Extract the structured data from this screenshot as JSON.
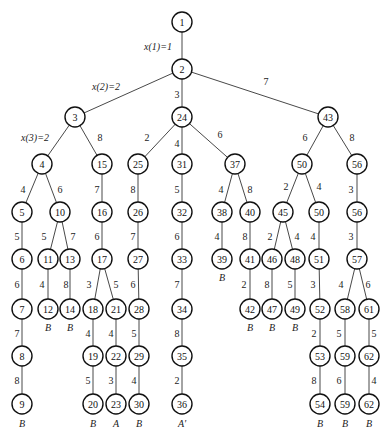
{
  "diagram": {
    "type": "search-tree",
    "node_radius": 10,
    "nodes": [
      {
        "id": "n1",
        "label": "1",
        "x": 182,
        "y": 22
      },
      {
        "id": "n2",
        "label": "2",
        "x": 182,
        "y": 69
      },
      {
        "id": "n3",
        "label": "3",
        "x": 75,
        "y": 117
      },
      {
        "id": "n24",
        "label": "24",
        "x": 182,
        "y": 117
      },
      {
        "id": "n43",
        "label": "43",
        "x": 328,
        "y": 117
      },
      {
        "id": "n4",
        "label": "4",
        "x": 42,
        "y": 164
      },
      {
        "id": "n15",
        "label": "15",
        "x": 102,
        "y": 164
      },
      {
        "id": "n25",
        "label": "25",
        "x": 138,
        "y": 164
      },
      {
        "id": "n31",
        "label": "31",
        "x": 182,
        "y": 164
      },
      {
        "id": "n37",
        "label": "37",
        "x": 235,
        "y": 164
      },
      {
        "id": "n50a",
        "label": "50",
        "x": 302,
        "y": 164
      },
      {
        "id": "n56a",
        "label": "56",
        "x": 357,
        "y": 164
      },
      {
        "id": "n5",
        "label": "5",
        "x": 22,
        "y": 212
      },
      {
        "id": "n10",
        "label": "10",
        "x": 60,
        "y": 212
      },
      {
        "id": "n16",
        "label": "16",
        "x": 102,
        "y": 212
      },
      {
        "id": "n26",
        "label": "26",
        "x": 138,
        "y": 212
      },
      {
        "id": "n32",
        "label": "32",
        "x": 182,
        "y": 212
      },
      {
        "id": "n38",
        "label": "38",
        "x": 222,
        "y": 212
      },
      {
        "id": "n40",
        "label": "40",
        "x": 250,
        "y": 212
      },
      {
        "id": "n45",
        "label": "45",
        "x": 283,
        "y": 212
      },
      {
        "id": "n50b",
        "label": "50",
        "x": 319,
        "y": 212
      },
      {
        "id": "n56b",
        "label": "56",
        "x": 357,
        "y": 212
      },
      {
        "id": "n6",
        "label": "6",
        "x": 22,
        "y": 259
      },
      {
        "id": "n11",
        "label": "11",
        "x": 48,
        "y": 259
      },
      {
        "id": "n13",
        "label": "13",
        "x": 70,
        "y": 259
      },
      {
        "id": "n17",
        "label": "17",
        "x": 102,
        "y": 259
      },
      {
        "id": "n27",
        "label": "27",
        "x": 138,
        "y": 259
      },
      {
        "id": "n33",
        "label": "33",
        "x": 182,
        "y": 259
      },
      {
        "id": "n39",
        "label": "39",
        "x": 222,
        "y": 259
      },
      {
        "id": "n41",
        "label": "41",
        "x": 250,
        "y": 259
      },
      {
        "id": "n46",
        "label": "46",
        "x": 272,
        "y": 259
      },
      {
        "id": "n48",
        "label": "48",
        "x": 295,
        "y": 259
      },
      {
        "id": "n51",
        "label": "51",
        "x": 319,
        "y": 259
      },
      {
        "id": "n57",
        "label": "57",
        "x": 357,
        "y": 259
      },
      {
        "id": "n7",
        "label": "7",
        "x": 22,
        "y": 309
      },
      {
        "id": "n12",
        "label": "12",
        "x": 48,
        "y": 309
      },
      {
        "id": "n14",
        "label": "14",
        "x": 70,
        "y": 309
      },
      {
        "id": "n18",
        "label": "18",
        "x": 93,
        "y": 309
      },
      {
        "id": "n21",
        "label": "21",
        "x": 116,
        "y": 309
      },
      {
        "id": "n28",
        "label": "28",
        "x": 139,
        "y": 309
      },
      {
        "id": "n34",
        "label": "34",
        "x": 182,
        "y": 309
      },
      {
        "id": "n42",
        "label": "42",
        "x": 250,
        "y": 309
      },
      {
        "id": "n47",
        "label": "47",
        "x": 272,
        "y": 309
      },
      {
        "id": "n49",
        "label": "49",
        "x": 295,
        "y": 309
      },
      {
        "id": "n52",
        "label": "52",
        "x": 320,
        "y": 309
      },
      {
        "id": "n58",
        "label": "58",
        "x": 345,
        "y": 309
      },
      {
        "id": "n61",
        "label": "61",
        "x": 369,
        "y": 309
      },
      {
        "id": "n8",
        "label": "8",
        "x": 22,
        "y": 356
      },
      {
        "id": "n19",
        "label": "19",
        "x": 93,
        "y": 356
      },
      {
        "id": "n22",
        "label": "22",
        "x": 116,
        "y": 356
      },
      {
        "id": "n29",
        "label": "29",
        "x": 139,
        "y": 356
      },
      {
        "id": "n35",
        "label": "35",
        "x": 182,
        "y": 356
      },
      {
        "id": "n53",
        "label": "53",
        "x": 320,
        "y": 356
      },
      {
        "id": "n59a",
        "label": "59",
        "x": 345,
        "y": 356
      },
      {
        "id": "n62a",
        "label": "62",
        "x": 369,
        "y": 356
      },
      {
        "id": "n9",
        "label": "9",
        "x": 22,
        "y": 404
      },
      {
        "id": "n20",
        "label": "20",
        "x": 93,
        "y": 404
      },
      {
        "id": "n23",
        "label": "23",
        "x": 116,
        "y": 404
      },
      {
        "id": "n30",
        "label": "30",
        "x": 139,
        "y": 404
      },
      {
        "id": "n36",
        "label": "36",
        "x": 182,
        "y": 404
      },
      {
        "id": "n54",
        "label": "54",
        "x": 320,
        "y": 404
      },
      {
        "id": "n59b",
        "label": "59",
        "x": 345,
        "y": 404
      },
      {
        "id": "n62b",
        "label": "62",
        "x": 369,
        "y": 404
      }
    ],
    "edges": [
      {
        "from": "n1",
        "to": "n2",
        "label": "x(1)=1",
        "lx": 158,
        "ly": 46,
        "italic": true
      },
      {
        "from": "n2",
        "to": "n3",
        "label": "x(2)=2",
        "lx": 106,
        "ly": 86,
        "italic": true
      },
      {
        "from": "n2",
        "to": "n24",
        "label": "3",
        "lx": 177,
        "ly": 94
      },
      {
        "from": "n2",
        "to": "n43",
        "label": "7",
        "lx": 266,
        "ly": 81
      },
      {
        "from": "n3",
        "to": "n4",
        "label": "x(3)=2",
        "lx": 35,
        "ly": 137,
        "italic": true
      },
      {
        "from": "n3",
        "to": "n15",
        "label": "8",
        "lx": 100,
        "ly": 137
      },
      {
        "from": "n24",
        "to": "n25",
        "label": "2",
        "lx": 147,
        "ly": 137
      },
      {
        "from": "n24",
        "to": "n31",
        "label": "4",
        "lx": 177,
        "ly": 143
      },
      {
        "from": "n24",
        "to": "n37",
        "label": "6",
        "lx": 220,
        "ly": 134
      },
      {
        "from": "n43",
        "to": "n50a",
        "label": "6",
        "lx": 305,
        "ly": 137
      },
      {
        "from": "n43",
        "to": "n56a",
        "label": "8",
        "lx": 352,
        "ly": 137
      },
      {
        "from": "n4",
        "to": "n5",
        "label": "4",
        "lx": 23,
        "ly": 189
      },
      {
        "from": "n4",
        "to": "n10",
        "label": "6",
        "lx": 60,
        "ly": 189
      },
      {
        "from": "n15",
        "to": "n16",
        "label": "7",
        "lx": 97,
        "ly": 189
      },
      {
        "from": "n25",
        "to": "n26",
        "label": "8",
        "lx": 133,
        "ly": 189
      },
      {
        "from": "n31",
        "to": "n32",
        "label": "5",
        "lx": 177,
        "ly": 189
      },
      {
        "from": "n37",
        "to": "n38",
        "label": "4",
        "lx": 221,
        "ly": 189
      },
      {
        "from": "n37",
        "to": "n40",
        "label": "8",
        "lx": 250,
        "ly": 189
      },
      {
        "from": "n50a",
        "to": "n45",
        "label": "2",
        "lx": 286,
        "ly": 186
      },
      {
        "from": "n50a",
        "to": "n50b",
        "label": "4",
        "lx": 319,
        "ly": 186
      },
      {
        "from": "n56a",
        "to": "n56b",
        "label": "3",
        "lx": 351,
        "ly": 189
      },
      {
        "from": "n5",
        "to": "n6",
        "label": "5",
        "lx": 17,
        "ly": 236
      },
      {
        "from": "n10",
        "to": "n11",
        "label": "5",
        "lx": 44,
        "ly": 236
      },
      {
        "from": "n10",
        "to": "n13",
        "label": "7",
        "lx": 73,
        "ly": 236
      },
      {
        "from": "n16",
        "to": "n17",
        "label": "6",
        "lx": 97,
        "ly": 236
      },
      {
        "from": "n26",
        "to": "n27",
        "label": "7",
        "lx": 133,
        "ly": 236
      },
      {
        "from": "n32",
        "to": "n33",
        "label": "6",
        "lx": 177,
        "ly": 236
      },
      {
        "from": "n38",
        "to": "n39",
        "label": "4",
        "lx": 217,
        "ly": 236
      },
      {
        "from": "n40",
        "to": "n41",
        "label": "8",
        "lx": 245,
        "ly": 236
      },
      {
        "from": "n45",
        "to": "n46",
        "label": "2",
        "lx": 270,
        "ly": 236
      },
      {
        "from": "n45",
        "to": "n48",
        "label": "4",
        "lx": 297,
        "ly": 236
      },
      {
        "from": "n50b",
        "to": "n51",
        "label": "4",
        "lx": 313,
        "ly": 236
      },
      {
        "from": "n56b",
        "to": "n57",
        "label": "3",
        "lx": 351,
        "ly": 236
      },
      {
        "from": "n6",
        "to": "n7",
        "label": "6",
        "lx": 17,
        "ly": 284
      },
      {
        "from": "n11",
        "to": "n12",
        "label": "4",
        "lx": 42,
        "ly": 284
      },
      {
        "from": "n13",
        "to": "n14",
        "label": "8",
        "lx": 66,
        "ly": 284
      },
      {
        "from": "n17",
        "to": "n18",
        "label": "3",
        "lx": 89,
        "ly": 284
      },
      {
        "from": "n17",
        "to": "n21",
        "label": "5",
        "lx": 116,
        "ly": 284
      },
      {
        "from": "n27",
        "to": "n28",
        "label": "6",
        "lx": 133,
        "ly": 284
      },
      {
        "from": "n33",
        "to": "n34",
        "label": "7",
        "lx": 177,
        "ly": 284
      },
      {
        "from": "n41",
        "to": "n42",
        "label": "2",
        "lx": 244,
        "ly": 284
      },
      {
        "from": "n46",
        "to": "n47",
        "label": "8",
        "lx": 267,
        "ly": 284
      },
      {
        "from": "n48",
        "to": "n49",
        "label": "5",
        "lx": 290,
        "ly": 284
      },
      {
        "from": "n51",
        "to": "n52",
        "label": "3",
        "lx": 313,
        "ly": 284
      },
      {
        "from": "n57",
        "to": "n58",
        "label": "4",
        "lx": 341,
        "ly": 284
      },
      {
        "from": "n57",
        "to": "n61",
        "label": "6",
        "lx": 368,
        "ly": 284
      },
      {
        "from": "n7",
        "to": "n8",
        "label": "7",
        "lx": 17,
        "ly": 333
      },
      {
        "from": "n18",
        "to": "n19",
        "label": "4",
        "lx": 88,
        "ly": 333
      },
      {
        "from": "n21",
        "to": "n22",
        "label": "4",
        "lx": 111,
        "ly": 333
      },
      {
        "from": "n28",
        "to": "n29",
        "label": "5",
        "lx": 134,
        "ly": 333
      },
      {
        "from": "n34",
        "to": "n35",
        "label": "8",
        "lx": 177,
        "ly": 333
      },
      {
        "from": "n52",
        "to": "n53",
        "label": "2",
        "lx": 314,
        "ly": 333
      },
      {
        "from": "n58",
        "to": "n59a",
        "label": "5",
        "lx": 339,
        "ly": 333
      },
      {
        "from": "n61",
        "to": "n62a",
        "label": "5",
        "lx": 374,
        "ly": 333
      },
      {
        "from": "n8",
        "to": "n9",
        "label": "8",
        "lx": 17,
        "ly": 380
      },
      {
        "from": "n19",
        "to": "n20",
        "label": "5",
        "lx": 88,
        "ly": 380
      },
      {
        "from": "n22",
        "to": "n23",
        "label": "3",
        "lx": 111,
        "ly": 380
      },
      {
        "from": "n29",
        "to": "n30",
        "label": "4",
        "lx": 134,
        "ly": 380
      },
      {
        "from": "n35",
        "to": "n36",
        "label": "2",
        "lx": 177,
        "ly": 380
      },
      {
        "from": "n53",
        "to": "n54",
        "label": "8",
        "lx": 314,
        "ly": 380
      },
      {
        "from": "n59a",
        "to": "n59b",
        "label": "6",
        "lx": 339,
        "ly": 380
      },
      {
        "from": "n62a",
        "to": "n62b",
        "label": "4",
        "lx": 374,
        "ly": 380
      }
    ],
    "leaf_labels": [
      {
        "node": "n12",
        "label": "B",
        "x": 48,
        "y": 327
      },
      {
        "node": "n14",
        "label": "B",
        "x": 70,
        "y": 327
      },
      {
        "node": "n39",
        "label": "B",
        "x": 222,
        "y": 277
      },
      {
        "node": "n42",
        "label": "B",
        "x": 250,
        "y": 327
      },
      {
        "node": "n47",
        "label": "B",
        "x": 272,
        "y": 327
      },
      {
        "node": "n49",
        "label": "B",
        "x": 295,
        "y": 327
      },
      {
        "node": "n9",
        "label": "B",
        "x": 22,
        "y": 423
      },
      {
        "node": "n20",
        "label": "B",
        "x": 93,
        "y": 423
      },
      {
        "node": "n23",
        "label": "A",
        "x": 116,
        "y": 423
      },
      {
        "node": "n30",
        "label": "B",
        "x": 139,
        "y": 423
      },
      {
        "node": "n36",
        "label": "A'",
        "x": 182,
        "y": 423
      },
      {
        "node": "n54",
        "label": "B",
        "x": 320,
        "y": 423
      },
      {
        "node": "n59b",
        "label": "B",
        "x": 345,
        "y": 423
      },
      {
        "node": "n62b",
        "label": "B",
        "x": 369,
        "y": 423
      }
    ]
  }
}
